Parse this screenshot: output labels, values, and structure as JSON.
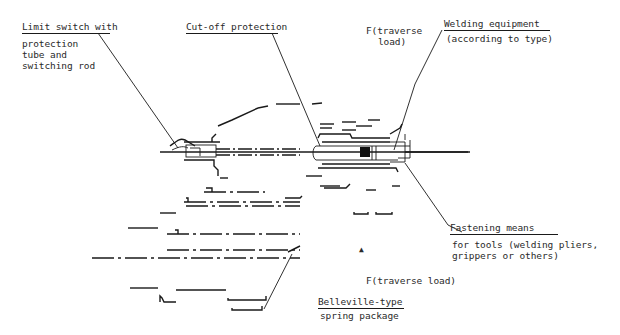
{
  "diagram": {
    "type": "technical-drawing",
    "labels": {
      "limit_switch": {
        "title": "Limit switch with",
        "line1": "protection",
        "line2": "tube and",
        "line3": "switching rod"
      },
      "cutoff": {
        "title": "Cut-off protection"
      },
      "traverse_top": {
        "line1": "F(traverse",
        "line2": "load)"
      },
      "welding": {
        "title": "Welding equipment",
        "line1": "(according to type)"
      },
      "fastening": {
        "title": "Fastening means",
        "line1": "for tools (welding pliers,",
        "line2": "grippers or others)"
      },
      "traverse_bottom": {
        "line1": "F(traverse load)"
      },
      "belleville": {
        "title": "Belleville-type",
        "line1": "spring package"
      }
    },
    "arrow_marker": "▲"
  }
}
